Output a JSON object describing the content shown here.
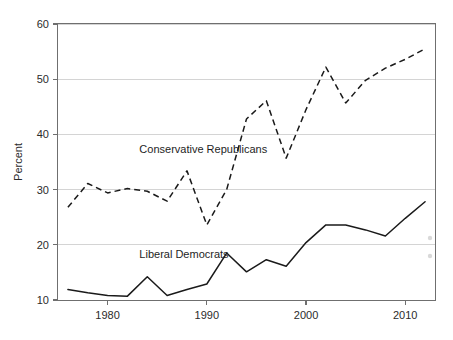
{
  "chart_data": {
    "type": "line",
    "title": "",
    "subtitle": "",
    "xlabel": "",
    "ylabel": "Percent",
    "xlim": [
      1975,
      2013
    ],
    "ylim": [
      10,
      60
    ],
    "grid": "horizontal",
    "legend_position": "inline-annotations",
    "x": [
      1976,
      1978,
      1980,
      1982,
      1984,
      1986,
      1988,
      1990,
      1992,
      1994,
      1996,
      1998,
      2000,
      2002,
      2004,
      2006,
      2008,
      2010,
      2012
    ],
    "xticks": [
      "1980",
      "1990",
      "2000",
      "2010"
    ],
    "xtick_values": [
      1980,
      1990,
      2000,
      2010
    ],
    "yticks": [
      "10",
      "20",
      "30",
      "40",
      "50",
      "60"
    ],
    "ytick_values": [
      10,
      20,
      30,
      40,
      50,
      60
    ],
    "series": [
      {
        "name": "Conservative Republicans",
        "style": "dashed",
        "color": "#1a1a1a",
        "values": [
          26.8,
          31.1,
          29.4,
          30.2,
          29.7,
          27.9,
          33.4,
          23.6,
          30.0,
          42.8,
          46.1,
          35.7,
          44.5,
          52.2,
          45.7,
          49.8,
          52.0,
          53.6,
          55.5
        ]
      },
      {
        "name": "Liberal Democrats",
        "style": "solid",
        "color": "#1a1a1a",
        "values": [
          11.9,
          11.3,
          10.8,
          10.7,
          14.2,
          10.8,
          11.9,
          12.9,
          18.5,
          15.1,
          17.3,
          16.1,
          20.4,
          23.6,
          23.6,
          22.7,
          21.6,
          24.8,
          27.8
        ]
      }
    ],
    "annotations": [
      {
        "text": "Conservative Republicans",
        "x": 1983.2,
        "y": 36.6
      },
      {
        "text": "Liberal Democrats",
        "x": 1983.2,
        "y": 17.6
      }
    ]
  }
}
